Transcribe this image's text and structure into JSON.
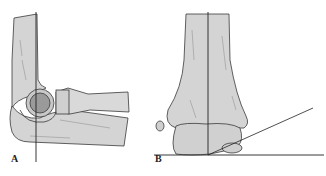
{
  "figure": {
    "panels": [
      {
        "label": "A",
        "subject": "elbow lateral view with vertical reference line"
      },
      {
        "label": "B",
        "subject": "distal humerus anterior view with carrying-angle lines"
      }
    ]
  },
  "colors": {
    "bone_fill": "#d4d4d4",
    "bone_shadow": "#bdbdbd",
    "outline": "#3a3a3a",
    "radial_head": "#9a9a9a",
    "background": "#ffffff"
  }
}
